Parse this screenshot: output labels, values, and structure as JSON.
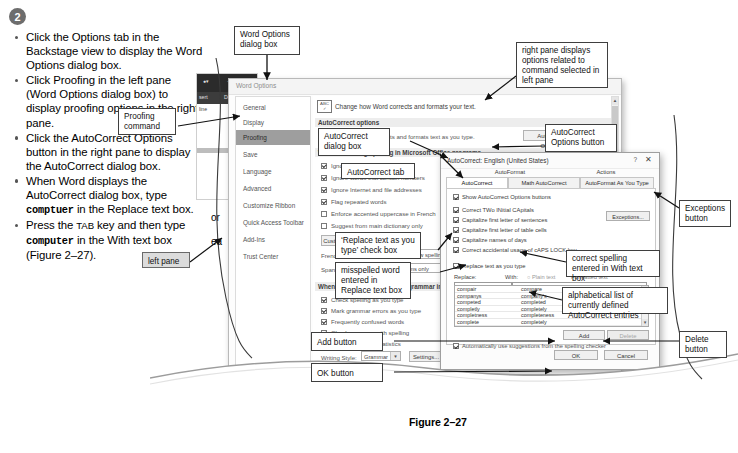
{
  "step": {
    "number": "2",
    "bullets": [
      "Click the Options tab in the Backstage view to display the Word Options dialog box.",
      "Click Proofing in the left pane (Word Options dialog box) to display proofing options in the right pane.",
      "Click the AutoCorrect Options button in the right pane to display the AutoCorrect dialog box.",
      "When Word displays the AutoCorrect dialog box, type comptuer in the Replace text box.",
      "Press the TAB key and then type computer in the With text box (Figure 2-27)."
    ]
  },
  "figure_caption": "Figure 2–27",
  "callouts": [
    {
      "id": "word-options-dialog-box",
      "text": "Word Options\ndialog box"
    },
    {
      "id": "proofing-command",
      "text": "Proofing\ncommand"
    },
    {
      "id": "right-pane",
      "text": "right pane displays options related to command selected in left pane"
    },
    {
      "id": "autocorrect-dialog-box",
      "text": "AutoCorrect\ndialog box"
    },
    {
      "id": "autocorrect-options-button",
      "text": "AutoCorrect\nOptions button"
    },
    {
      "id": "autocorrect-tab",
      "text": "AutoCorrect tab"
    },
    {
      "id": "exceptions-button",
      "text": "Exceptions\nbutton"
    },
    {
      "id": "replace-text-as-you-type-check-box",
      "text": "‘Replace text as you type’ check box"
    },
    {
      "id": "correct-spelling",
      "text": "correct spelling entered in With text box"
    },
    {
      "id": "left-pane",
      "text": "left pane"
    },
    {
      "id": "misspelled-word",
      "text": "misspelled word entered in Replace text box"
    },
    {
      "id": "alphabetical-list",
      "text": "alphabetical list of currently defined AutoCorrect entries"
    },
    {
      "id": "add-button",
      "text": "Add button"
    },
    {
      "id": "delete-button",
      "text": "Delete\nbutton"
    },
    {
      "id": "ok-button",
      "text": "OK button"
    }
  ],
  "word_window": {
    "title_bar_items": [
      "▾",
      "·",
      "·"
    ],
    "ribbon_tabs": [
      "sert",
      "Desig"
    ],
    "labels": [
      "line"
    ]
  },
  "word_options": {
    "title": "Word Options",
    "left_pane": [
      "General",
      "Display",
      "Proofing",
      "Save",
      "Language",
      "Advanced",
      "Customize Ribbon",
      "Quick Access Toolbar",
      "Add-Ins",
      "Trust Center"
    ],
    "selected": "Proofing",
    "header_text": "Change how Word corrects and formats your text.",
    "header_icon": "ABC-check-icon",
    "sections": {
      "autocorrect": {
        "heading": "AutoCorrect options",
        "sub": "Change how Word corrects and formats text as you type.",
        "button": "AutoCorrect Options..."
      },
      "office_spelling": {
        "heading": "When correcting spelling in Microsoft Office programs",
        "checkboxes": [
          {
            "label": "Ignore words in UPPERCASE",
            "checked": true
          },
          {
            "label": "Ignore words that contain numbers",
            "checked": true
          },
          {
            "label": "Ignore Internet and file addresses",
            "checked": true
          },
          {
            "label": "Flag repeated words",
            "checked": true
          },
          {
            "label": "Enforce accented uppercase in French",
            "checked": false
          },
          {
            "label": "Suggest from main dictionary only",
            "checked": false
          }
        ],
        "custom_dict_button": "Custom Dictionaries...",
        "french_label": "French modes:",
        "french_value": "Traditional and new spellings",
        "spanish_label": "Spanish modes:",
        "spanish_value": "Tuteo verb forms only"
      },
      "word_spelling": {
        "heading": "When correcting spelling and grammar in Word",
        "checkboxes": [
          {
            "label": "Check spelling as you type",
            "checked": true
          },
          {
            "label": "Mark grammar errors as you type",
            "checked": true
          },
          {
            "label": "Frequently confused words",
            "checked": true
          },
          {
            "label": "Check grammar with spelling",
            "checked": true
          },
          {
            "label": "Show readability statistics",
            "checked": false
          }
        ],
        "writing_style_label": "Writing Style:",
        "writing_style_value": "Grammar",
        "settings_button": "Settings...",
        "recheck_button": "Recheck Document"
      },
      "exceptions": {
        "label": "Exceptions for:",
        "value": "Headphones and Earbuds Paper",
        "icon": "document-icon"
      }
    }
  },
  "autocorrect_dialog": {
    "title": "AutoCorrect: English (United States)",
    "help_icon": "?",
    "close_icon": "✕",
    "top_tabs": [
      "AutoFormat",
      "Actions"
    ],
    "tabs": [
      "AutoCorrect",
      "Math AutoCorrect",
      "AutoFormat As You Type"
    ],
    "active_tab": "AutoCorrect",
    "checkboxes": [
      {
        "label": "Show AutoCorrect Options buttons",
        "checked": true
      },
      {
        "label": "Correct TWo INitial CApitals",
        "checked": true
      },
      {
        "label": "Capitalize first letter of sentences",
        "checked": true
      },
      {
        "label": "Capitalize first letter of table cells",
        "checked": true
      },
      {
        "label": "Capitalize names of days",
        "checked": true
      },
      {
        "label": "Correct accidental usage of cAPS LOCK key",
        "checked": true
      },
      {
        "label": "Replace text as you type",
        "checked": true
      }
    ],
    "exceptions_button": "Exceptions...",
    "replace_label": "Replace:",
    "with_label": "With:",
    "plain_text_radio": "Plain text",
    "formatted_text_radio": "Formatted text",
    "replace_value": "comptuer",
    "with_value": "computer",
    "entries": [
      {
        "replace": "compair",
        "with": "compare"
      },
      {
        "replace": "companys",
        "with": "company's"
      },
      {
        "replace": "competed",
        "with": "completed"
      },
      {
        "replace": "completly",
        "with": "completely"
      },
      {
        "replace": "completness",
        "with": "completeness"
      },
      {
        "replace": "complete",
        "with": "completely"
      }
    ],
    "entry_columns": [
      "Replace",
      "With"
    ],
    "add_button": "Add",
    "delete_button": "Delete",
    "auto_suggest_checkbox": "Automatically use suggestions from the spelling checker",
    "ok_button": "OK",
    "cancel_button": "Cancel"
  },
  "colors": {
    "callout_bg": "#ebebeb",
    "callout_border": "#3f3f3f",
    "badge_bg": "#6d6d6d",
    "selected_item_bg": "#9e9e9e",
    "word_titlebar": "#2b2b2b"
  }
}
